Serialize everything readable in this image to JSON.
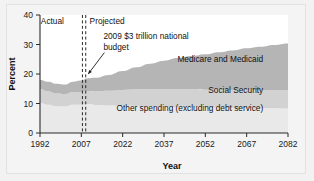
{
  "chart_data": {
    "type": "area",
    "stacked": true,
    "title": "",
    "xlabel": "Year",
    "ylabel": "Percent",
    "xlim": [
      1992,
      2082
    ],
    "ylim": [
      0,
      40
    ],
    "xticks": [
      1992,
      2007,
      2022,
      2037,
      2052,
      2067,
      2082
    ],
    "yticks": [
      0,
      10,
      20,
      30,
      40
    ],
    "grid": false,
    "legend_position": "inline-band-labels",
    "x": [
      1992,
      1995,
      1998,
      2001,
      2004,
      2007,
      2009,
      2012,
      2017,
      2022,
      2027,
      2032,
      2037,
      2042,
      2047,
      2052,
      2057,
      2062,
      2067,
      2072,
      2077,
      2082
    ],
    "series": [
      {
        "name": "Other spending (excluding debt service)",
        "color": "#e9e9e9",
        "values": [
          10.2,
          9.6,
          9.1,
          9.0,
          9.6,
          9.6,
          9.8,
          9.5,
          9.3,
          9.2,
          9.1,
          9.0,
          8.9,
          8.8,
          8.7,
          8.6,
          8.6,
          8.5,
          8.5,
          8.4,
          8.4,
          8.3
        ]
      },
      {
        "name": "Social Security",
        "color": "#d2d2d2",
        "values": [
          4.6,
          4.5,
          4.3,
          4.2,
          4.3,
          4.3,
          4.4,
          4.6,
          5.0,
          5.4,
          5.7,
          5.9,
          6.0,
          6.1,
          6.1,
          6.1,
          6.1,
          6.1,
          6.2,
          6.2,
          6.2,
          6.2
        ]
      },
      {
        "name": "Medicare and Medicaid",
        "color": "#b5b5b5",
        "values": [
          3.2,
          3.3,
          3.3,
          3.2,
          3.5,
          3.9,
          4.3,
          4.6,
          5.4,
          6.4,
          7.5,
          8.6,
          9.6,
          10.5,
          11.3,
          12.0,
          12.7,
          13.4,
          14.0,
          14.6,
          15.2,
          15.8
        ]
      }
    ],
    "annotations": [
      {
        "name": "actual-label",
        "text": "Actual",
        "x": 1996.5,
        "y": 37.0
      },
      {
        "name": "projected-label",
        "text": "Projected",
        "x": 2010.0,
        "y": 37.0
      },
      {
        "name": "budget-callout",
        "text_line1": "2009 $3 trillion national",
        "text_line2": "budget",
        "x": 2015.0,
        "y": 32.0,
        "target_x": 2009.5,
        "target_y": 20.0
      }
    ],
    "divider": {
      "name": "actual-projected-divider",
      "x_values": [
        2007.4,
        2008.6
      ],
      "style": "dashed"
    },
    "band_labels": [
      {
        "name": "medicare-and-medicaid",
        "text": "Medicare and Medicaid",
        "x": 2073,
        "y": 24.0
      },
      {
        "name": "social-security",
        "text": "Social Security",
        "x": 2073,
        "y": 13.6
      },
      {
        "name": "other-spending",
        "text": "Other spending (excluding debt service)",
        "x": 2073,
        "y": 7.4
      }
    ]
  }
}
